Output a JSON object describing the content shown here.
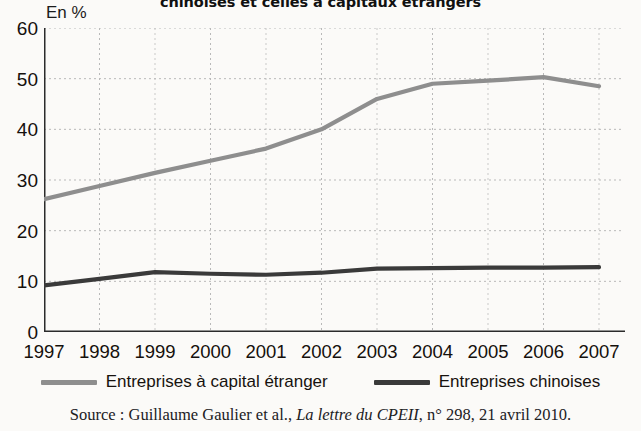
{
  "title": "chinoises et celles à capitaux étrangers",
  "axis_unit": "En %",
  "source": {
    "prefix": "Source : Guillaume Gaulier et al., ",
    "italic": "La lettre du CPEII",
    "suffix": ", n° 298, 21 avril 2010."
  },
  "colors": {
    "foreign": "#8e8e8e",
    "chinese": "#3a3a3a",
    "axis": "#2b2b2b",
    "grid": "#b9b9b9",
    "background": "#fbfaf8",
    "text": "#15100c"
  },
  "legend": [
    {
      "label": "Entreprises à capital étranger",
      "color": "#8e8e8e"
    },
    {
      "label": "Entreprises chinoises",
      "color": "#3a3a3a"
    }
  ],
  "chart_data": {
    "type": "line",
    "title": "chinoises et celles à capitaux étrangers",
    "xlabel": "",
    "ylabel": "En %",
    "ylim": [
      0,
      60
    ],
    "yticks": [
      0,
      10,
      20,
      30,
      40,
      50,
      60
    ],
    "grid": true,
    "legend_position": "bottom",
    "categories": [
      "1997",
      "1998",
      "1999",
      "2000",
      "2001",
      "2002",
      "2003",
      "2004",
      "2005",
      "2006",
      "2007"
    ],
    "series": [
      {
        "name": "Entreprises à capital étranger",
        "color": "#8e8e8e",
        "values": [
          26.2,
          28.8,
          31.4,
          33.8,
          36.2,
          40.0,
          46.0,
          49.0,
          49.6,
          50.3,
          48.5
        ]
      },
      {
        "name": "Entreprises chinoises",
        "color": "#3a3a3a",
        "values": [
          9.2,
          10.5,
          11.8,
          11.5,
          11.3,
          11.7,
          12.5,
          12.6,
          12.7,
          12.7,
          12.8
        ]
      }
    ]
  }
}
